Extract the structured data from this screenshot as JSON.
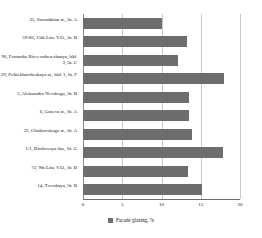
{
  "chart_data": {
    "type": "bar",
    "orientation": "horizontal",
    "title": "",
    "xlabel": "",
    "ylabel": "",
    "xlim": [
      0,
      20
    ],
    "grid": true,
    "legend_position": "bottom",
    "bar_color": "#6d6d6d",
    "gridline_color": "#c9c9c9",
    "xticks": [
      0,
      5,
      10,
      15,
      20
    ],
    "xtick_labels": [
      "0",
      "5",
      "10",
      "15",
      "20"
    ],
    "categories": [
      "35, Savushkina st., lit. A",
      "59-60, 15th Line V.O., lit. B",
      "90, Fontanka River naberezhnaya, bld. 3, lit. C",
      "29, Politekhnicheskaya st., bld. 1, lit. F",
      "5, Aleksandra Nevskogo, lit. B",
      "6, Guseva st., lit. A",
      "22, Chaikovskogo st., lit. A",
      "1/1, Birzhevaya line, lit. G",
      "72, 9th Line V.O., lit. B",
      "14, Tverskaya, lit. B"
    ],
    "series": [
      {
        "name": "Facade glazing, %",
        "values": [
          10.0,
          13.3,
          12.1,
          17.9,
          13.5,
          13.5,
          13.9,
          17.8,
          13.4,
          15.2
        ]
      }
    ]
  },
  "legend": {
    "label": "Facade glazing, %",
    "swatch_name": "legend-color-swatch"
  }
}
